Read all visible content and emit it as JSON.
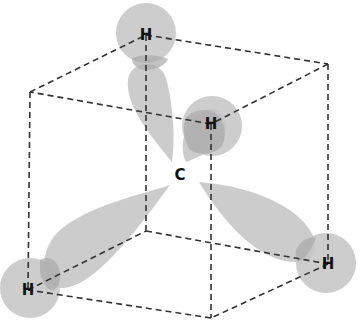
{
  "diagram": {
    "title": "",
    "colors": {
      "background": "#ffffff",
      "lobe": "#c8c8c8",
      "atom_sphere": "#c4c4c4",
      "overlap": "#a8a8a8",
      "edge": "#333333",
      "label": "#111111"
    },
    "atoms": [
      {
        "id": "carbon",
        "label": "C",
        "x": 180,
        "y": 175
      },
      {
        "id": "h-top",
        "label": "H",
        "x": 146,
        "y": 35
      },
      {
        "id": "h-front",
        "label": "H",
        "x": 211,
        "y": 124
      },
      {
        "id": "h-right",
        "label": "H",
        "x": 328,
        "y": 264
      },
      {
        "id": "h-left",
        "label": "H",
        "x": 28,
        "y": 290
      }
    ],
    "cube_vertices": {
      "top_back": [
        146,
        35
      ],
      "top_right": [
        328,
        64
      ],
      "top_front": [
        211,
        124
      ],
      "top_left": [
        30,
        92
      ],
      "bottom_back": [
        146,
        231
      ],
      "bottom_right": [
        328,
        264
      ],
      "bottom_front": [
        211,
        318
      ],
      "bottom_left": [
        28,
        290
      ]
    }
  }
}
